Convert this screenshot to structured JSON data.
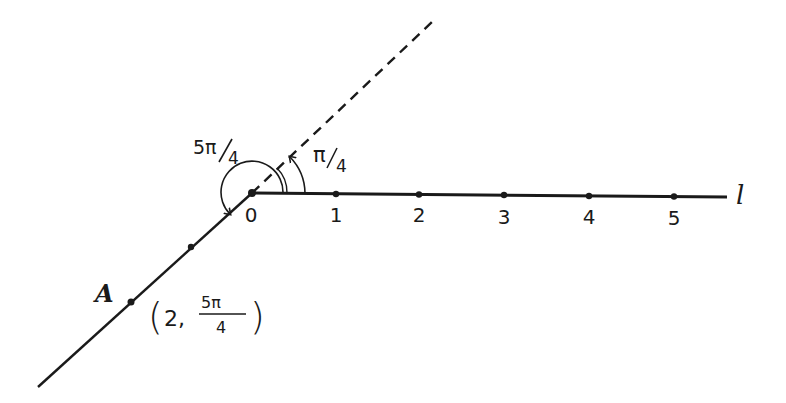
{
  "diagram": {
    "colors": {
      "ink": "#1a1a1a",
      "background": "#ffffff"
    },
    "origin_label": "0",
    "axis_label": "l",
    "ticks": [
      "1",
      "2",
      "3",
      "4",
      "5"
    ],
    "angle_small": {
      "num": "π",
      "den": "4"
    },
    "angle_large": {
      "num": "5π",
      "den": "4"
    },
    "point": {
      "name": "A",
      "coord_r": "2,",
      "coord_theta_num": "5π",
      "coord_theta_den": "4",
      "paren_open": "(",
      "paren_close": ")"
    }
  }
}
